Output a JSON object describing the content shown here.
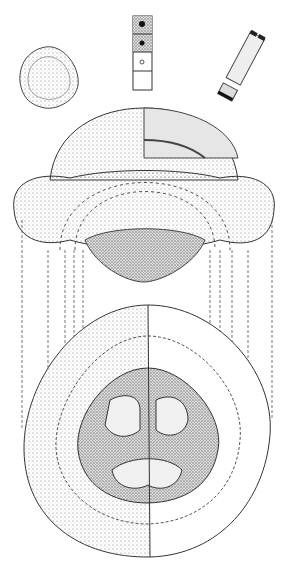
{
  "figure": {
    "background": "#ffffff",
    "ink": "#333333",
    "stipple": "#9a9a9a",
    "parts": [
      "small grain view",
      "wall strip detail",
      "rod detail",
      "side view",
      "polar section view"
    ]
  }
}
